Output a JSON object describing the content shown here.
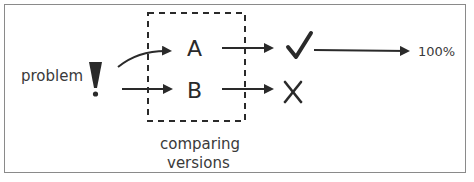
{
  "diagram": {
    "problem_label": "problem",
    "problem_symbol": "!",
    "versions": [
      {
        "label": "A",
        "outcome": "success",
        "outcome_symbol": "check-icon"
      },
      {
        "label": "B",
        "outcome": "failure",
        "outcome_symbol": "x-icon"
      }
    ],
    "group_label_line1": "comparing",
    "group_label_line2": "versions",
    "result_label": "100%"
  },
  "colors": {
    "ink": "#2a2a2a",
    "text": "#3a3a3a",
    "frame": "#8a8a8a"
  }
}
